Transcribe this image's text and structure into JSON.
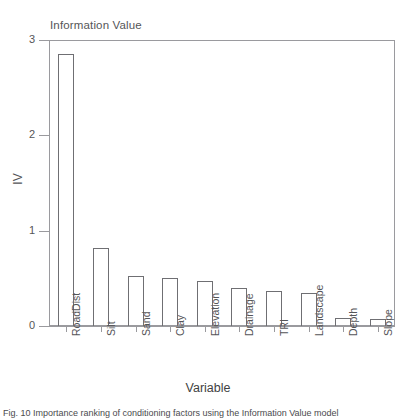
{
  "chart_data": {
    "type": "bar",
    "title": "Information Value",
    "xlabel": "Variable",
    "ylabel": "IV",
    "categories": [
      "RoadDist",
      "Silt",
      "Sand",
      "Clay",
      "Elevation",
      "Drainage",
      "TRI",
      "Landscape",
      "Depth",
      "Slope"
    ],
    "values": [
      2.85,
      0.82,
      0.52,
      0.5,
      0.47,
      0.4,
      0.37,
      0.35,
      0.08,
      0.07
    ],
    "ylim": [
      0,
      3
    ],
    "yticks": [
      "0",
      "1",
      "2",
      "3"
    ],
    "ytick_values": [
      0,
      1,
      2,
      3
    ],
    "grid": false,
    "legend": null,
    "bar_fill": "#ffffff",
    "bar_stroke": "#6f6f73",
    "axis_color": "#9a9a9e",
    "text_color": "#555558"
  },
  "caption": {
    "text": "Fig. 10 Importance ranking of conditioning factors using the Information Value model"
  }
}
